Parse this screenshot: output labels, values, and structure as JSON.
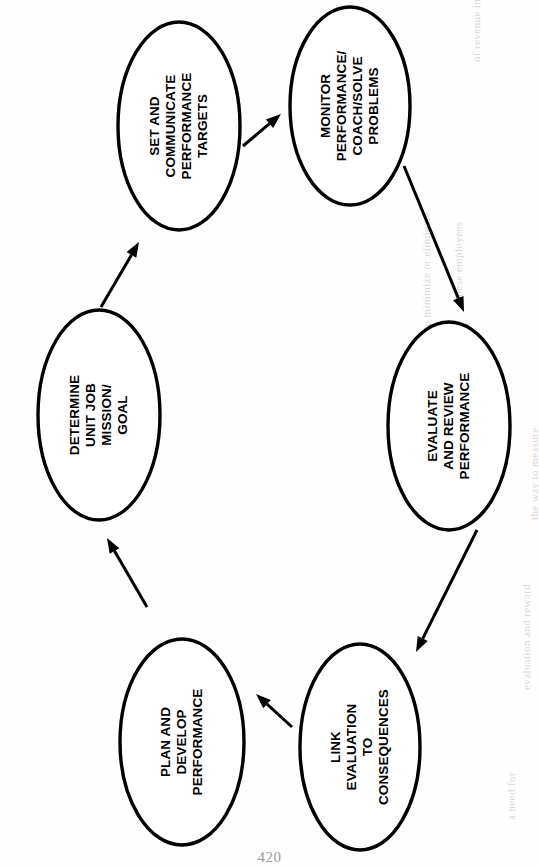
{
  "document": {
    "page_number": "420",
    "diagram_title": "Performance Management Cycle",
    "orientation": "rotated-90-ccw",
    "ink_color": "#000000",
    "page_color": "#fefefe"
  },
  "diagram": {
    "type": "cycle",
    "node_count": 6,
    "arrow_count": 6,
    "nodes": [
      {
        "id": "determine-unit-job-mission-goal",
        "lines": [
          "DETERMINE",
          "UNIT JOB",
          "MISSION/",
          "GOAL"
        ],
        "cx": 99,
        "cy": 415,
        "rx": 61,
        "ry": 105
      },
      {
        "id": "set-and-communicate-performance-targets",
        "lines": [
          "SET AND",
          "COMMUNICATE",
          "PERFORMANCE",
          "TARGETS"
        ],
        "cx": 179,
        "cy": 126,
        "rx": 61,
        "ry": 104
      },
      {
        "id": "monitor-performance-coach-solve-problems",
        "lines": [
          "MONITOR",
          "PERFORMANCE/",
          "COACH/SOLVE",
          "PROBLEMS"
        ],
        "cx": 350,
        "cy": 106,
        "rx": 60,
        "ry": 99
      },
      {
        "id": "evaluate-and-review-performance",
        "lines": [
          "EVALUATE",
          "AND REVIEW",
          "PERFORMANCE"
        ],
        "cx": 449,
        "cy": 426,
        "rx": 61,
        "ry": 104
      },
      {
        "id": "link-evaluation-to-consequences",
        "lines": [
          "LINK",
          "EVALUATION",
          "TO",
          "CONSEQUENCES"
        ],
        "cx": 360,
        "cy": 747,
        "rx": 60,
        "ry": 103
      },
      {
        "id": "plan-and-develop-performance",
        "lines": [
          "PLAN AND",
          "DEVELOP",
          "PERFORMANCE"
        ],
        "cx": 182,
        "cy": 742,
        "rx": 62,
        "ry": 103
      }
    ],
    "arrows": [
      {
        "id": "arrow-set-to-monitor",
        "from": "set-and-communicate-performance-targets",
        "to": "monitor-performance-coach-solve-problems",
        "x1": 243,
        "y1": 146,
        "x2": 281,
        "y2": 114
      },
      {
        "id": "arrow-monitor-to-evaluate",
        "from": "monitor-performance-coach-solve-problems",
        "to": "evaluate-and-review-performance",
        "x1": 404,
        "y1": 166,
        "x2": 464,
        "y2": 312
      },
      {
        "id": "arrow-evaluate-to-link",
        "from": "evaluate-and-review-performance",
        "to": "link-evaluation-to-consequences",
        "x1": 477,
        "y1": 530,
        "x2": 416,
        "y2": 652
      },
      {
        "id": "arrow-link-to-plan",
        "from": "link-evaluation-to-consequences",
        "to": "plan-and-develop-performance",
        "x1": 292,
        "y1": 727,
        "x2": 256,
        "y2": 694
      },
      {
        "id": "arrow-plan-to-determine",
        "from": "plan-and-develop-performance",
        "to": "determine-unit-job-mission-goal",
        "x1": 147,
        "y1": 607,
        "x2": 107,
        "y2": 538
      },
      {
        "id": "arrow-determine-to-set",
        "from": "determine-unit-job-mission-goal",
        "to": "set-and-communicate-performance-targets",
        "x1": 101,
        "y1": 307,
        "x2": 139,
        "y2": 242
      }
    ]
  },
  "bleed_through": [
    {
      "text": "of revenue improvement",
      "x": 470,
      "y": 62
    },
    {
      "text": "these employees",
      "x": 452,
      "y": 300
    },
    {
      "text": "and how",
      "x": 438,
      "y": 430
    },
    {
      "text": "to minimize or eliminate",
      "x": 420,
      "y": 330
    },
    {
      "text": "the way to measure",
      "x": 528,
      "y": 520
    },
    {
      "text": "evaluation and reward",
      "x": 520,
      "y": 690
    },
    {
      "text": "a need for",
      "x": 505,
      "y": 820
    }
  ]
}
